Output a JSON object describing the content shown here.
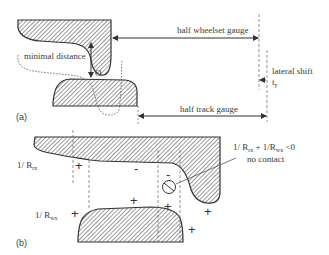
{
  "figure": {
    "panel_a": {
      "tag": "(a)",
      "labels": {
        "minimal_distance": "minimal distance",
        "point_o": "O",
        "half_wheelset_gauge": "half wheelset gauge",
        "lateral_shift": "lateral shift",
        "lateral_shift_symbol": "t",
        "lateral_shift_sub": "y",
        "half_track_gauge": "half track gauge"
      }
    },
    "panel_b": {
      "tag": "(b)",
      "labels": {
        "rx_prefix": "1/ R",
        "rx_sub": "rx",
        "wx_prefix": "1/ R",
        "wx_sub": "wx",
        "condition_a": "1/ R",
        "condition_a_sub": "rx",
        "condition_plus": " + 1/R",
        "condition_b_sub": "wx",
        "condition_lt": " <0",
        "no_contact": "no contact"
      },
      "signs": {
        "plus": "+",
        "minus": "-"
      }
    }
  }
}
